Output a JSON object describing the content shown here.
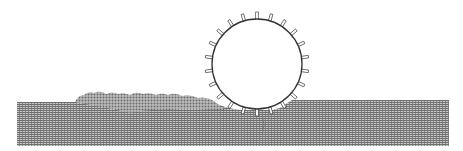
{
  "diagram": {
    "wheel": {
      "cx": 257,
      "cy": 64,
      "r": 45,
      "stroke": "#333333",
      "fill": "#ffffff",
      "grouser_count": 22
    },
    "ground": {
      "left_x": 17,
      "right_x": 449,
      "left_top_y": 102,
      "right_top_y": 100,
      "bottom_y": 146,
      "color": "#8a8a8a"
    },
    "rubble": {
      "from_x": 75,
      "to_x": 215,
      "peak_y": 92
    }
  }
}
